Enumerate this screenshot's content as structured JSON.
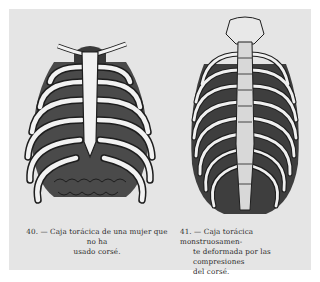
{
  "figures": [
    {
      "number": "40.",
      "caption_line1": "40. — Caja torácica de una mujer que no ha",
      "caption_line2": "usado corsé.",
      "illustration": "normal-ribcage-illustration"
    },
    {
      "number": "41.",
      "caption_line1": "41. — Caja torácica monstruosamen-",
      "caption_line2": "te deformada por las compresiones",
      "caption_line3": "del corsé.",
      "illustration": "deformed-ribcage-illustration"
    }
  ],
  "colors": {
    "page": "#e5e5e5",
    "ink": "#1e1e1e",
    "bone": "#f2f2f2",
    "shade": "#5a5a5a"
  }
}
